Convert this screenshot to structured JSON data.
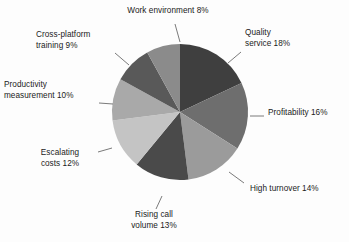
{
  "chart_data": {
    "type": "pie",
    "title": "",
    "xlabel": "",
    "ylabel": "",
    "legend_position": "callout-labels",
    "grid": false,
    "start_angle_deg": 0,
    "direction": "clockwise",
    "categories": [
      "Quality service",
      "Profitability",
      "High turnover",
      "Rising call volume",
      "Escalating costs",
      "Productivity measurement",
      "Cross-platform training",
      "Work environment"
    ],
    "values": [
      18,
      16,
      14,
      13,
      12,
      10,
      9,
      8
    ],
    "value_unit": "%",
    "colors": [
      "#3f3f3f",
      "#6e6e6e",
      "#9b9b9b",
      "#4a4a4a",
      "#c4c4c4",
      "#a9a9a9",
      "#595959",
      "#8b8b8b"
    ],
    "slices": [
      {
        "label": "Quality service",
        "value": 18,
        "color": "#3f3f3f"
      },
      {
        "label": "Profitability",
        "value": 16,
        "color": "#6e6e6e"
      },
      {
        "label": "High turnover",
        "value": 14,
        "color": "#9b9b9b"
      },
      {
        "label": "Rising call volume",
        "value": 13,
        "color": "#4a4a4a"
      },
      {
        "label": "Escalating costs",
        "value": 12,
        "color": "#c4c4c4"
      },
      {
        "label": "Productivity measurement",
        "value": 10,
        "color": "#a9a9a9"
      },
      {
        "label": "Cross-platform training",
        "value": 9,
        "color": "#595959"
      },
      {
        "label": "Work environment",
        "value": 8,
        "color": "#8b8b8b"
      }
    ]
  },
  "labels": {
    "work_environment": "Work environment 8%",
    "quality_service": "Quality\nservice 18%",
    "profitability": "Profitability 16%",
    "high_turnover": "High turnover 14%",
    "rising_call_volume": "Rising call\nvolume 13%",
    "escalating_costs": "Escalating\ncosts 12%",
    "productivity_measurement": "Productivity\nmeasurement 10%",
    "cross_platform_training": "Cross-platform\ntraining 9%"
  },
  "style": {
    "background": "#fdfdfd",
    "text_color": "#1b1b1b",
    "leader_line_color": "#6b6b6b"
  }
}
